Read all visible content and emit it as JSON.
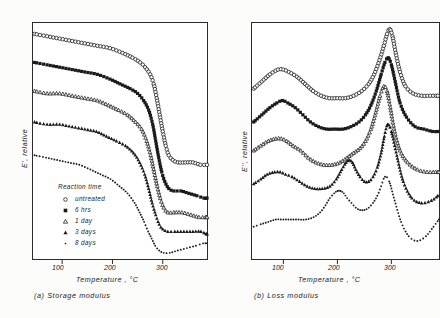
{
  "figure": {
    "panels": [
      {
        "id": "a",
        "caption": "(a)  Storage  modulus",
        "ylabel": "E', relative",
        "xlabel": "Temperature , °C",
        "xticks": [
          "100",
          "200",
          "300"
        ]
      },
      {
        "id": "b",
        "caption": "(b)  Loss  modulus",
        "ylabel": "E'', relative",
        "xlabel": "Temperature , °C",
        "xticks": [
          "100",
          "200",
          "300"
        ]
      }
    ],
    "legend": {
      "title": "Reaction  time",
      "items": [
        {
          "label": "untreated",
          "marker": "open-circle"
        },
        {
          "label": "6  hrs",
          "marker": "filled-square"
        },
        {
          "label": "1  day",
          "marker": "open-triangle"
        },
        {
          "label": "3  days",
          "marker": "filled-triangle"
        },
        {
          "label": "8  days",
          "marker": "dot"
        }
      ]
    },
    "colors": {
      "ink": "#1a1a1a",
      "frame": "#2b2b2b",
      "background": "#ffffff"
    }
  },
  "chart_data": [
    {
      "type": "scatter",
      "title": "(a) Storage modulus",
      "xlabel": "Temperature , °C",
      "ylabel": "E', relative",
      "xlim": [
        40,
        390
      ],
      "ylim": [
        0,
        100
      ],
      "xticks": [
        100,
        200,
        300
      ],
      "grid": false,
      "legend_position": "inside-lower-left",
      "series": [
        {
          "name": "untreated",
          "marker": "open-circle",
          "x": [
            45,
            70,
            95,
            120,
            145,
            170,
            195,
            220,
            240,
            255,
            265,
            275,
            282,
            288,
            294,
            300,
            306,
            312,
            320,
            330,
            345,
            360,
            375,
            388
          ],
          "y": [
            95,
            94,
            93,
            92,
            91,
            90,
            89,
            87,
            85,
            83,
            81,
            78,
            74,
            68,
            61,
            54,
            48,
            44,
            42,
            41,
            41,
            41,
            40,
            40
          ]
        },
        {
          "name": "6 hrs",
          "marker": "filled-square",
          "x": [
            45,
            70,
            95,
            120,
            145,
            170,
            195,
            215,
            235,
            250,
            262,
            272,
            280,
            286,
            292,
            298,
            304,
            312,
            322,
            336,
            352,
            368,
            382,
            388
          ],
          "y": [
            83,
            82,
            81,
            80,
            79,
            78,
            76,
            74,
            72,
            70,
            67,
            63,
            57,
            50,
            43,
            37,
            33,
            30,
            29,
            29,
            28,
            27,
            26,
            26
          ]
        },
        {
          "name": "1 day",
          "marker": "open-triangle",
          "x": [
            45,
            70,
            95,
            120,
            145,
            170,
            192,
            212,
            230,
            246,
            258,
            268,
            276,
            283,
            289,
            295,
            302,
            310,
            322,
            338,
            356,
            372,
            385,
            388
          ],
          "y": [
            71,
            70,
            70,
            69,
            68,
            67,
            65,
            63,
            61,
            58,
            55,
            50,
            44,
            37,
            31,
            26,
            22,
            20,
            20,
            20,
            19,
            18,
            18,
            18
          ]
        },
        {
          "name": "3 days",
          "marker": "filled-triangle",
          "x": [
            45,
            70,
            95,
            120,
            145,
            168,
            188,
            208,
            226,
            242,
            254,
            264,
            272,
            279,
            286,
            293,
            300,
            310,
            324,
            342,
            360,
            376,
            386,
            388
          ],
          "y": [
            58,
            57,
            57,
            56,
            55,
            54,
            52,
            50,
            48,
            45,
            41,
            36,
            30,
            24,
            19,
            15,
            13,
            12,
            12,
            12,
            12,
            12,
            11,
            11
          ]
        },
        {
          "name": "8 days",
          "marker": "dot",
          "x": [
            45,
            68,
            90,
            112,
            134,
            156,
            176,
            196,
            214,
            230,
            244,
            254,
            263,
            271,
            278,
            285,
            293,
            302,
            314,
            330,
            348,
            366,
            380,
            388
          ],
          "y": [
            44,
            43,
            42,
            41,
            40,
            38,
            36,
            34,
            31,
            28,
            24,
            20,
            16,
            12,
            9,
            6,
            4,
            3,
            3,
            4,
            5,
            6,
            7,
            7
          ]
        }
      ]
    },
    {
      "type": "scatter",
      "title": "(b) Loss modulus",
      "xlabel": "Temperature , °C",
      "ylabel": "E'', relative",
      "xlim": [
        40,
        390
      ],
      "ylim": [
        0,
        100
      ],
      "xticks": [
        100,
        200,
        300
      ],
      "grid": false,
      "legend_position": "none",
      "series": [
        {
          "name": "untreated",
          "marker": "open-circle",
          "x": [
            45,
            60,
            75,
            90,
            100,
            110,
            125,
            140,
            155,
            170,
            185,
            200,
            215,
            230,
            245,
            258,
            268,
            278,
            286,
            292,
            297,
            302,
            308,
            316,
            326,
            340,
            356,
            372,
            386
          ],
          "y": [
            72,
            75,
            78,
            80,
            80,
            79,
            77,
            74,
            71,
            69,
            68,
            68,
            68,
            69,
            71,
            74,
            78,
            84,
            90,
            95,
            97,
            94,
            87,
            79,
            73,
            70,
            69,
            69,
            69
          ]
        },
        {
          "name": "6 hrs",
          "marker": "filled-square",
          "x": [
            45,
            60,
            75,
            88,
            98,
            108,
            122,
            136,
            150,
            165,
            180,
            195,
            210,
            225,
            240,
            252,
            262,
            272,
            281,
            288,
            294,
            300,
            307,
            316,
            328,
            344,
            360,
            376,
            386
          ],
          "y": [
            58,
            61,
            64,
            66,
            67,
            66,
            64,
            61,
            58,
            56,
            55,
            55,
            55,
            56,
            58,
            61,
            65,
            71,
            78,
            83,
            85,
            82,
            75,
            66,
            60,
            56,
            55,
            54,
            54
          ]
        },
        {
          "name": "1 day",
          "marker": "open-triangle",
          "x": [
            45,
            58,
            72,
            86,
            96,
            106,
            118,
            132,
            146,
            160,
            175,
            190,
            205,
            218,
            230,
            242,
            252,
            262,
            271,
            279,
            286,
            292,
            298,
            306,
            316,
            330,
            348,
            366,
            382,
            388
          ],
          "y": [
            46,
            48,
            50,
            51,
            51,
            50,
            48,
            46,
            43,
            41,
            40,
            40,
            41,
            43,
            45,
            47,
            50,
            55,
            62,
            69,
            73,
            71,
            64,
            54,
            46,
            41,
            38,
            37,
            37,
            37
          ]
        },
        {
          "name": "3 days",
          "marker": "filled-triangle",
          "x": [
            45,
            58,
            70,
            84,
            94,
            104,
            116,
            130,
            144,
            158,
            172,
            186,
            198,
            208,
            216,
            222,
            228,
            234,
            242,
            250,
            258,
            266,
            274,
            281,
            287,
            293,
            300,
            310,
            322,
            338,
            356,
            374,
            386
          ],
          "y": [
            32,
            34,
            36,
            37,
            37,
            36,
            35,
            33,
            31,
            30,
            30,
            31,
            34,
            38,
            41,
            42,
            41,
            38,
            35,
            33,
            33,
            35,
            39,
            45,
            52,
            57,
            54,
            44,
            33,
            26,
            24,
            25,
            27
          ]
        },
        {
          "name": "8 days",
          "marker": "dot",
          "x": [
            45,
            58,
            72,
            86,
            100,
            114,
            128,
            142,
            156,
            168,
            178,
            186,
            194,
            200,
            206,
            212,
            218,
            226,
            234,
            242,
            250,
            258,
            266,
            274,
            281,
            288,
            296,
            306,
            318,
            332,
            348,
            364,
            378,
            388
          ],
          "y": [
            14,
            15,
            16,
            17,
            17,
            17,
            17,
            17,
            18,
            20,
            23,
            26,
            28,
            29,
            29,
            28,
            26,
            24,
            22,
            21,
            21,
            22,
            24,
            27,
            31,
            35,
            33,
            25,
            16,
            10,
            8,
            10,
            14,
            17
          ]
        }
      ]
    }
  ]
}
